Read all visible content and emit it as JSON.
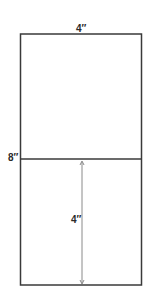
{
  "diagram": {
    "type": "dimensioned-rectangle",
    "shape": {
      "outer_rect": {
        "x": 20,
        "y": 34,
        "width": 122,
        "height": 251
      },
      "divider_y": 159,
      "stroke_color": "#3a3a3a",
      "stroke_width": 1.5
    },
    "labels": {
      "top_width": "4″",
      "left_height": "8″",
      "inner_dimension": "4″"
    },
    "arrow": {
      "x": 82,
      "y1": 161,
      "y2": 284,
      "color": "#8a8a8a"
    }
  }
}
